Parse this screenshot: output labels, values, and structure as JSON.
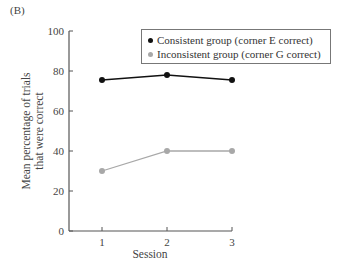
{
  "panel_label": "(B)",
  "chart_data": {
    "type": "line",
    "title": "",
    "xlabel": "Session",
    "ylabel": "Mean percentage of trials that were correct",
    "ylabel_lines": [
      "Mean percentage of trials",
      "that were correct"
    ],
    "x": [
      1,
      2,
      3
    ],
    "categories": [
      "1",
      "2",
      "3"
    ],
    "ylim": [
      0,
      100
    ],
    "yticks": [
      0,
      20,
      40,
      60,
      80,
      100
    ],
    "grid": false,
    "legend_position": "top-right",
    "series": [
      {
        "name": "Consistent group (corner E correct)",
        "color": "#111111",
        "values": [
          75.5,
          78,
          75.5
        ]
      },
      {
        "name": "Inconsistent group (corner G correct)",
        "color": "#a8a8a8",
        "values": [
          30,
          40,
          40
        ]
      }
    ]
  }
}
